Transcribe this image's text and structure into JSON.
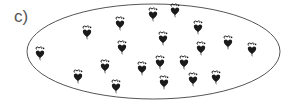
{
  "figure": {
    "label": "c)",
    "ellipse": {
      "cx": 153.5,
      "cy": 51.5,
      "rx": 126.5,
      "ry": 47.5,
      "stroke": "#555555"
    },
    "item_icon": "heart-with-bow-icon",
    "item_color": "#1a1a1a",
    "item_count": 20,
    "items": [
      {
        "x": 87,
        "y": 33
      },
      {
        "x": 120,
        "y": 24
      },
      {
        "x": 153,
        "y": 15
      },
      {
        "x": 175,
        "y": 11
      },
      {
        "x": 198,
        "y": 28
      },
      {
        "x": 163,
        "y": 39
      },
      {
        "x": 122,
        "y": 48
      },
      {
        "x": 201,
        "y": 49
      },
      {
        "x": 228,
        "y": 43
      },
      {
        "x": 252,
        "y": 50
      },
      {
        "x": 40,
        "y": 54
      },
      {
        "x": 105,
        "y": 67
      },
      {
        "x": 142,
        "y": 69
      },
      {
        "x": 160,
        "y": 63
      },
      {
        "x": 184,
        "y": 63
      },
      {
        "x": 78,
        "y": 77
      },
      {
        "x": 116,
        "y": 87
      },
      {
        "x": 164,
        "y": 83
      },
      {
        "x": 193,
        "y": 80
      },
      {
        "x": 216,
        "y": 78
      }
    ]
  }
}
